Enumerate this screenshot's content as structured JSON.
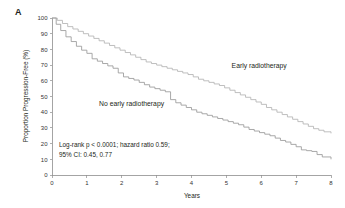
{
  "panel": {
    "label": "A"
  },
  "chart_data": {
    "type": "line",
    "title": "",
    "subtitle": "",
    "xlabel": "Years",
    "ylabel": "Proportion Progression-Free (%)",
    "xlim": [
      0,
      8
    ],
    "ylim": [
      0,
      100
    ],
    "xticks": [
      0,
      1,
      2,
      3,
      4,
      5,
      6,
      7,
      8
    ],
    "yticks": [
      0,
      10,
      20,
      30,
      40,
      50,
      60,
      70,
      80,
      90,
      100
    ],
    "grid": false,
    "legend_position": "inline-annotations",
    "colors": {
      "early": "#b3b3b3",
      "no_early": "#9a9a9a",
      "axis": "#8d8d8d",
      "text": "#231f20"
    },
    "annotations": [
      "Log-rank p < 0.0001; hazard ratio 0.59;",
      "95% CI: 0.45, 0.77"
    ],
    "series": [
      {
        "name": "Early radiotherapy",
        "label_x": 5.15,
        "label_y": 68,
        "x": [
          0,
          0.15,
          0.3,
          0.45,
          0.6,
          0.75,
          0.9,
          1.05,
          1.2,
          1.35,
          1.5,
          1.65,
          1.8,
          1.95,
          2.1,
          2.25,
          2.4,
          2.55,
          2.7,
          2.85,
          3.0,
          3.15,
          3.3,
          3.45,
          3.6,
          3.75,
          3.9,
          4.05,
          4.2,
          4.35,
          4.5,
          4.65,
          4.8,
          4.95,
          5.1,
          5.25,
          5.4,
          5.55,
          5.7,
          5.85,
          6.0,
          6.15,
          6.3,
          6.45,
          6.6,
          6.75,
          6.9,
          7.05,
          7.2,
          7.35,
          7.5,
          7.65,
          7.8,
          8.0
        ],
        "y": [
          100,
          98.5,
          96.5,
          94.5,
          93,
          91.5,
          90,
          88.5,
          87,
          85.5,
          84,
          82.5,
          81,
          79.5,
          78,
          76.5,
          75,
          73.5,
          72,
          71,
          70,
          69,
          68,
          67,
          66,
          65,
          64,
          62.5,
          61,
          60,
          59,
          58,
          57,
          55.5,
          54,
          52.5,
          51,
          49.5,
          48,
          46.5,
          45,
          43,
          41.5,
          40,
          38.5,
          37,
          35.5,
          34,
          32.5,
          31,
          29.5,
          28.5,
          27.5,
          26.5
        ]
      },
      {
        "name": "No early radiotherapy",
        "label_x": 1.35,
        "label_y": 44,
        "x": [
          0,
          0.12,
          0.25,
          0.4,
          0.55,
          0.7,
          0.85,
          1.0,
          1.15,
          1.3,
          1.45,
          1.6,
          1.75,
          1.9,
          2.05,
          2.2,
          2.35,
          2.5,
          2.65,
          2.8,
          2.95,
          3.1,
          3.25,
          3.4,
          3.55,
          3.7,
          3.85,
          4.0,
          4.15,
          4.3,
          4.45,
          4.6,
          4.75,
          4.9,
          5.05,
          5.2,
          5.35,
          5.5,
          5.65,
          5.8,
          5.95,
          6.1,
          6.25,
          6.4,
          6.55,
          6.7,
          6.85,
          7.0,
          7.15,
          7.3,
          7.45,
          7.6,
          7.75,
          8.0
        ],
        "y": [
          100,
          96,
          92,
          88,
          85,
          82,
          79.5,
          77.5,
          74,
          72.5,
          71,
          69.5,
          68,
          65,
          62.5,
          61.5,
          60.5,
          59,
          57.5,
          56,
          55,
          54,
          53,
          48,
          46,
          44.5,
          43,
          41.5,
          40,
          39,
          38,
          37,
          36,
          35,
          34,
          33,
          32,
          30.5,
          29,
          28,
          27,
          26,
          25,
          23.5,
          22,
          21,
          19.5,
          18,
          16,
          15.5,
          15,
          13,
          11.5,
          10
        ]
      }
    ]
  }
}
